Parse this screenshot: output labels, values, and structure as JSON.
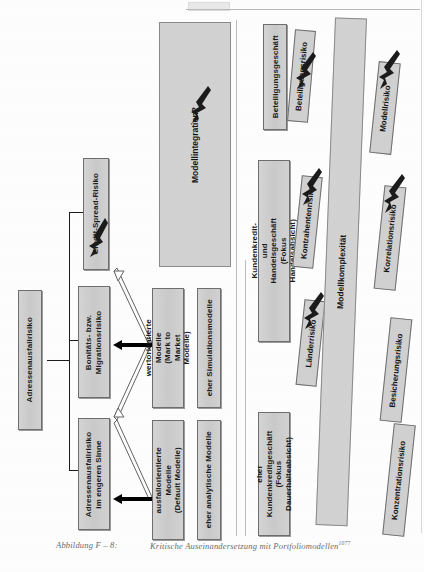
{
  "figure": {
    "caption_number": "Abbildung F – 8:",
    "caption_text": "Kritische Auseinandersetzung mit Portfoliomodellen",
    "caption_footnote": "1077"
  },
  "risk_hierarchy": {
    "root": {
      "label": "Adressenausfallrisiko"
    },
    "children": [
      {
        "label": "Credit-Spread-Risiko",
        "marker": "flag-marker"
      },
      {
        "label": "Bonitäts- bzw.\nMigrationsrisiko"
      },
      {
        "label": "Adressenausfallrisiko\nim engeren Sinne"
      }
    ]
  },
  "model_columns": {
    "value_based": {
      "model_type": "wertorientierte Modelle\n(Mark to Market Modelle)",
      "method": "eher Simulationsmodelle"
    },
    "default_based": {
      "model_type": "ausfallorientierte Modelle\n(Default Modelle)",
      "method": "eher analytische Modelle"
    }
  },
  "integration_panel": {
    "label": "Modellintegration?",
    "marker": "flag-marker"
  },
  "business_segments": [
    {
      "label": "Beteiligungsgeschäft",
      "risks": [
        {
          "label": "Beteiligungsrisiko",
          "marker": "flag-marker"
        }
      ]
    },
    {
      "label": "Kundenkredit- und Handelsgeschäft\n(Fokus Handelsabsicht)",
      "risks": [
        {
          "label": "Kontrahentenrisiko",
          "marker": "flag-marker"
        },
        {
          "label": "Länderrisiko",
          "marker": "flag-marker"
        }
      ]
    },
    {
      "label": "eher Kundenkreditgeschäft\n(Fokus Dauerhalteabsicht)",
      "risks": []
    }
  ],
  "complexity_panel": {
    "label": "Modellkomplexität",
    "risks": [
      {
        "label": "Modellrisiko",
        "marker": "flag-marker"
      },
      {
        "label": "Korrelationsrisiko",
        "marker": "flag-marker"
      },
      {
        "label": "Besicherungsrisiko",
        "marker": "flag-marker"
      },
      {
        "label": "Konzentrationsrisiko",
        "marker": "flag-marker"
      }
    ]
  },
  "colors": {
    "box_fill": "#cfcfcf",
    "box_border": "#6e6e6e",
    "panel_fill": "#d2d2d2",
    "arrow": "#000000",
    "page_bg": "#fdfdfd"
  }
}
